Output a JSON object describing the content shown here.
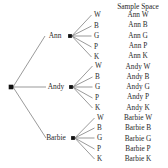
{
  "figure": {
    "type": "probability-tree-diagram",
    "background_color": "#ffffff",
    "line_color": "#6e6e6e",
    "node_color": "#111111",
    "text_color": "#2a2a2a"
  },
  "sample_space": {
    "header": "Sample Space",
    "rows": [
      "Ann W",
      "Ann B",
      "Ann G",
      "Ann P",
      "Ann K",
      "Andy W",
      "Andy B",
      "Andy G",
      "Andy P",
      "Andy K",
      "Barbie W",
      "Barbie B",
      "Barbie G",
      "Barbie P",
      "Barbie K"
    ]
  },
  "tree": {
    "root": {
      "label": "",
      "x": 11,
      "y": 87
    },
    "level1": [
      {
        "label": "Ann",
        "label_x": 55,
        "label_y": 36,
        "node_x": 70,
        "node_y": 36
      },
      {
        "label": "Andy",
        "label_x": 56,
        "label_y": 87,
        "node_x": 71,
        "node_y": 87
      },
      {
        "label": "Barbie",
        "label_x": 56,
        "label_y": 138,
        "node_x": 73,
        "node_y": 138
      }
    ],
    "level2_letters": [
      "W",
      "B",
      "G",
      "P",
      "K"
    ],
    "level2": [
      {
        "parent": "Ann",
        "letters": [
          {
            "text": "W",
            "x": 94,
            "y": 15
          },
          {
            "text": "B",
            "x": 94,
            "y": 26
          },
          {
            "text": "G",
            "x": 94,
            "y": 36
          },
          {
            "text": "P",
            "x": 94,
            "y": 47
          },
          {
            "text": "K",
            "x": 94,
            "y": 57
          }
        ]
      },
      {
        "parent": "Andy",
        "letters": [
          {
            "text": "W",
            "x": 95,
            "y": 66
          },
          {
            "text": "B",
            "x": 95,
            "y": 77
          },
          {
            "text": "G",
            "x": 95,
            "y": 87
          },
          {
            "text": "P",
            "x": 95,
            "y": 98
          },
          {
            "text": "K",
            "x": 95,
            "y": 108
          }
        ]
      },
      {
        "parent": "Barbie",
        "letters": [
          {
            "text": "W",
            "x": 97,
            "y": 118
          },
          {
            "text": "B",
            "x": 97,
            "y": 128
          },
          {
            "text": "G",
            "x": 97,
            "y": 138
          },
          {
            "text": "P",
            "x": 97,
            "y": 149
          },
          {
            "text": "K",
            "x": 97,
            "y": 159
          }
        ]
      }
    ]
  },
  "sample_space_row_geometry": {
    "first_row_y": 15,
    "row_spacing": 10.3
  }
}
